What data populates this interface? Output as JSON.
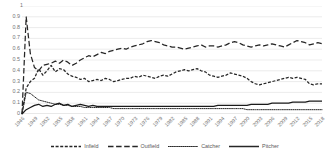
{
  "chart_data": {
    "type": "line",
    "title": "",
    "xlabel": "",
    "ylabel": "",
    "ylim": [
      0,
      1
    ],
    "y_ticks": [
      "0",
      "0.1",
      "0.2",
      "0.3",
      "0.4",
      "0.5",
      "0.6",
      "0.7",
      "0.8",
      "0.9",
      "1"
    ],
    "grid": "horizontal",
    "legend_position": "bottom",
    "x_start": 1946,
    "x_end": 2018,
    "x_tick_step": 3,
    "x_tick_labels": [
      "1946",
      "1949",
      "1952",
      "1955",
      "1958",
      "1961",
      "1964",
      "1967",
      "1970",
      "1973",
      "1976",
      "1979",
      "1982",
      "1985",
      "1988",
      "1991",
      "1994",
      "1997",
      "2000",
      "2003",
      "2006",
      "2009",
      "2012",
      "2015",
      "2018"
    ],
    "x": [
      1946,
      1947,
      1948,
      1949,
      1950,
      1951,
      1952,
      1953,
      1954,
      1955,
      1956,
      1957,
      1958,
      1959,
      1960,
      1961,
      1962,
      1963,
      1964,
      1965,
      1966,
      1967,
      1968,
      1969,
      1970,
      1971,
      1972,
      1973,
      1974,
      1975,
      1976,
      1977,
      1978,
      1979,
      1980,
      1981,
      1982,
      1983,
      1984,
      1985,
      1986,
      1987,
      1988,
      1989,
      1990,
      1991,
      1992,
      1993,
      1994,
      1995,
      1996,
      1997,
      1998,
      1999,
      2000,
      2001,
      2002,
      2003,
      2004,
      2005,
      2006,
      2007,
      2008,
      2009,
      2010,
      2011,
      2012,
      2013,
      2014,
      2015,
      2016,
      2017,
      2018
    ],
    "series": [
      {
        "name": "Infield",
        "dash": "medium-dash",
        "color": "#262626",
        "values": [
          0.0,
          0.24,
          0.3,
          0.33,
          0.42,
          0.36,
          0.4,
          0.45,
          0.39,
          0.42,
          0.41,
          0.37,
          0.35,
          0.34,
          0.32,
          0.33,
          0.3,
          0.31,
          0.32,
          0.31,
          0.33,
          0.32,
          0.3,
          0.31,
          0.32,
          0.33,
          0.33,
          0.35,
          0.34,
          0.36,
          0.35,
          0.34,
          0.33,
          0.35,
          0.36,
          0.35,
          0.37,
          0.39,
          0.4,
          0.41,
          0.4,
          0.41,
          0.42,
          0.4,
          0.39,
          0.36,
          0.35,
          0.34,
          0.35,
          0.36,
          0.38,
          0.37,
          0.36,
          0.35,
          0.33,
          0.3,
          0.28,
          0.27,
          0.28,
          0.29,
          0.3,
          0.31,
          0.32,
          0.33,
          0.34,
          0.33,
          0.34,
          0.33,
          0.32,
          0.28,
          0.27,
          0.28,
          0.28
        ]
      },
      {
        "name": "Outfield",
        "dash": "long-dash",
        "color": "#262626",
        "values": [
          0.0,
          0.9,
          0.56,
          0.43,
          0.4,
          0.45,
          0.46,
          0.47,
          0.49,
          0.47,
          0.5,
          0.48,
          0.45,
          0.47,
          0.5,
          0.52,
          0.54,
          0.53,
          0.55,
          0.57,
          0.56,
          0.58,
          0.59,
          0.6,
          0.61,
          0.6,
          0.62,
          0.63,
          0.64,
          0.65,
          0.67,
          0.68,
          0.67,
          0.66,
          0.64,
          0.63,
          0.62,
          0.62,
          0.61,
          0.6,
          0.61,
          0.62,
          0.63,
          0.64,
          0.62,
          0.63,
          0.63,
          0.62,
          0.63,
          0.64,
          0.66,
          0.67,
          0.66,
          0.64,
          0.63,
          0.62,
          0.63,
          0.64,
          0.63,
          0.64,
          0.65,
          0.64,
          0.63,
          0.62,
          0.64,
          0.66,
          0.68,
          0.67,
          0.66,
          0.64,
          0.65,
          0.66,
          0.65
        ]
      },
      {
        "name": "Catcher",
        "dash": "dotted",
        "color": "#262626",
        "values": [
          0.0,
          0.2,
          0.19,
          0.16,
          0.13,
          0.12,
          0.11,
          0.1,
          0.09,
          0.09,
          0.08,
          0.08,
          0.07,
          0.07,
          0.07,
          0.06,
          0.06,
          0.06,
          0.06,
          0.06,
          0.06,
          0.06,
          0.05,
          0.05,
          0.05,
          0.05,
          0.05,
          0.05,
          0.05,
          0.05,
          0.05,
          0.05,
          0.05,
          0.05,
          0.05,
          0.05,
          0.05,
          0.05,
          0.05,
          0.05,
          0.05,
          0.05,
          0.05,
          0.05,
          0.05,
          0.05,
          0.05,
          0.05,
          0.05,
          0.05,
          0.05,
          0.05,
          0.05,
          0.05,
          0.04,
          0.04,
          0.04,
          0.04,
          0.04,
          0.04,
          0.04,
          0.04,
          0.04,
          0.04,
          0.04,
          0.04,
          0.04,
          0.04,
          0.04,
          0.04,
          0.04,
          0.04,
          0.04
        ]
      },
      {
        "name": "Pitcher",
        "dash": "solid",
        "color": "#1a1a1a",
        "values": [
          0.0,
          0.04,
          0.06,
          0.08,
          0.09,
          0.07,
          0.08,
          0.07,
          0.09,
          0.1,
          0.08,
          0.09,
          0.07,
          0.08,
          0.09,
          0.08,
          0.07,
          0.08,
          0.07,
          0.07,
          0.07,
          0.07,
          0.07,
          0.07,
          0.07,
          0.07,
          0.07,
          0.07,
          0.07,
          0.07,
          0.07,
          0.07,
          0.07,
          0.07,
          0.07,
          0.07,
          0.07,
          0.07,
          0.07,
          0.07,
          0.07,
          0.07,
          0.07,
          0.07,
          0.07,
          0.07,
          0.07,
          0.08,
          0.08,
          0.08,
          0.08,
          0.08,
          0.08,
          0.08,
          0.08,
          0.09,
          0.09,
          0.09,
          0.09,
          0.09,
          0.1,
          0.1,
          0.1,
          0.1,
          0.1,
          0.11,
          0.11,
          0.11,
          0.11,
          0.12,
          0.12,
          0.12,
          0.12
        ]
      }
    ]
  },
  "legend": {
    "items": [
      {
        "label": "Infield",
        "dash": "medium-dash"
      },
      {
        "label": "Outfield",
        "dash": "long-dash"
      },
      {
        "label": "Catcher",
        "dash": "dotted"
      },
      {
        "label": "Pitcher",
        "dash": "solid"
      }
    ]
  }
}
